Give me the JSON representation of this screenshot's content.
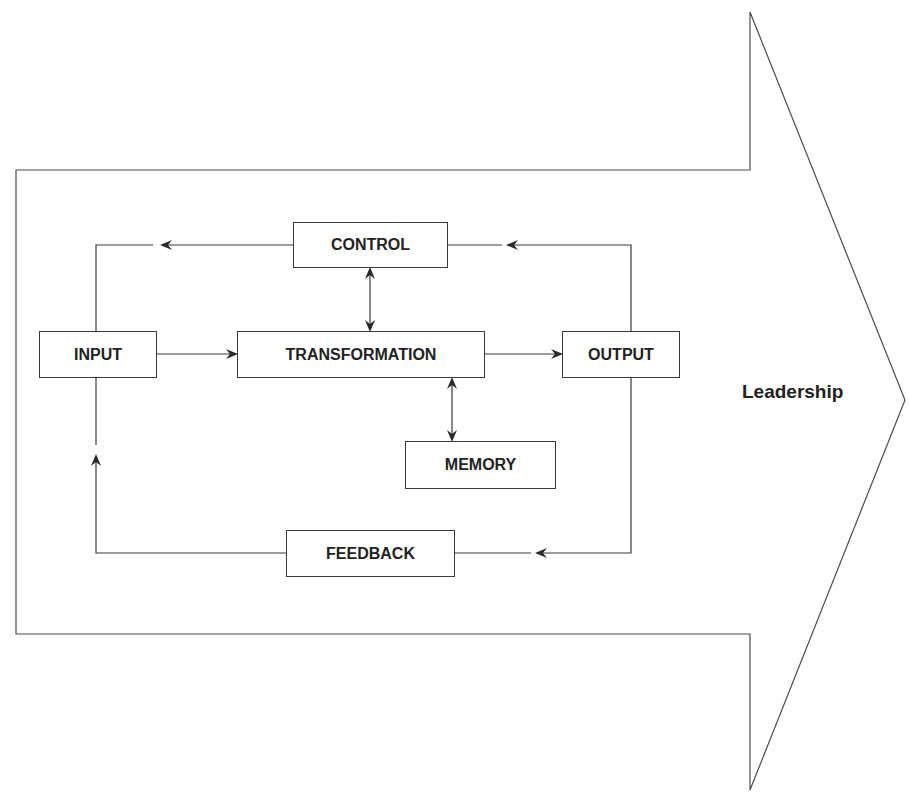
{
  "diagram": {
    "type": "systems-model",
    "container_label": "Leadership",
    "nodes": {
      "control": "CONTROL",
      "input": "INPUT",
      "transformation": "TRANSFORMATION",
      "output": "OUTPUT",
      "memory": "MEMORY",
      "feedback": "FEEDBACK"
    },
    "edges": [
      {
        "from": "INPUT",
        "to": "TRANSFORMATION",
        "direction": "one-way"
      },
      {
        "from": "TRANSFORMATION",
        "to": "OUTPUT",
        "direction": "one-way"
      },
      {
        "from": "CONTROL",
        "to": "TRANSFORMATION",
        "direction": "two-way"
      },
      {
        "from": "TRANSFORMATION",
        "to": "MEMORY",
        "direction": "two-way"
      },
      {
        "from": "OUTPUT",
        "to": "CONTROL",
        "direction": "one-way"
      },
      {
        "from": "CONTROL",
        "to": "INPUT",
        "direction": "one-way"
      },
      {
        "from": "OUTPUT",
        "to": "FEEDBACK",
        "direction": "one-way"
      },
      {
        "from": "FEEDBACK",
        "to": "INPUT",
        "direction": "one-way"
      }
    ],
    "colors": {
      "line": "#3a3a3a",
      "text": "#222222",
      "background": "#ffffff"
    }
  }
}
